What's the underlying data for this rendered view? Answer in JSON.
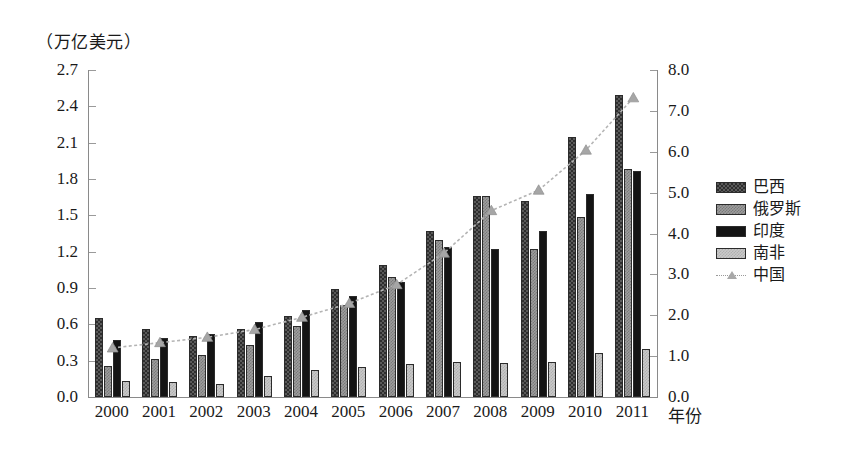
{
  "unit_caption": "（万亿美元）",
  "axis": {
    "x_title": "年份",
    "y_left_ticks": [
      "0.0",
      "0.3",
      "0.6",
      "0.9",
      "1.2",
      "1.5",
      "1.8",
      "2.1",
      "2.4",
      "2.7"
    ],
    "y_right_ticks": [
      "0.0",
      "1.0",
      "2.0",
      "3.0",
      "4.0",
      "5.0",
      "6.0",
      "7.0",
      "8.0"
    ]
  },
  "legend": {
    "items": [
      {
        "label": "巴西",
        "key": "brazil",
        "type": "bar",
        "color": "#5a5a5a"
      },
      {
        "label": "俄罗斯",
        "key": "russia",
        "type": "bar",
        "color": "#9d9d9d"
      },
      {
        "label": "印度",
        "key": "india",
        "type": "bar",
        "color": "#141414"
      },
      {
        "label": "南非",
        "key": "southafrica",
        "type": "bar",
        "color": "#c9c9c9"
      },
      {
        "label": "中国",
        "key": "china",
        "type": "line",
        "color": "#a8a8a8"
      }
    ]
  },
  "chart_data": {
    "type": "bar",
    "title": "",
    "subtitle": "",
    "xlabel": "年份",
    "ylabel": "（万亿美元）",
    "ylim": [
      0.0,
      2.7
    ],
    "y2lim": [
      0.0,
      8.0
    ],
    "grid": false,
    "legend_position": "right",
    "categories": [
      "2000",
      "2001",
      "2002",
      "2003",
      "2004",
      "2005",
      "2006",
      "2007",
      "2008",
      "2009",
      "2010",
      "2011"
    ],
    "series": [
      {
        "name": "巴西",
        "axis": "left",
        "kind": "bar",
        "values": [
          0.65,
          0.56,
          0.5,
          0.56,
          0.67,
          0.89,
          1.09,
          1.37,
          1.66,
          1.62,
          2.15,
          2.49
        ]
      },
      {
        "name": "俄罗斯",
        "axis": "left",
        "kind": "bar",
        "values": [
          0.26,
          0.31,
          0.35,
          0.43,
          0.59,
          0.76,
          0.99,
          1.3,
          1.66,
          1.22,
          1.49,
          1.88
        ]
      },
      {
        "name": "印度",
        "axis": "left",
        "kind": "bar",
        "values": [
          0.47,
          0.49,
          0.52,
          0.62,
          0.72,
          0.83,
          0.95,
          1.24,
          1.22,
          1.37,
          1.68,
          1.87
        ]
      },
      {
        "name": "南非",
        "axis": "left",
        "kind": "bar",
        "values": [
          0.13,
          0.12,
          0.11,
          0.17,
          0.22,
          0.25,
          0.27,
          0.29,
          0.28,
          0.29,
          0.36,
          0.4
        ]
      },
      {
        "name": "中国",
        "axis": "right",
        "kind": "line",
        "values": [
          1.2,
          1.33,
          1.46,
          1.65,
          1.95,
          2.29,
          2.75,
          3.52,
          4.56,
          5.06,
          6.04,
          7.32
        ]
      }
    ]
  }
}
